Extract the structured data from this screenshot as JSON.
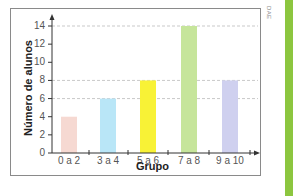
{
  "credit": "DAE",
  "chart_data": {
    "type": "bar",
    "title": "",
    "xlabel": "Grupo",
    "ylabel": "Número de alunos",
    "categories": [
      "0 a 2",
      "3 a 4",
      "5 a 6",
      "7 a 8",
      "9 a 10"
    ],
    "values": [
      4,
      6,
      8,
      14,
      8
    ],
    "colors": [
      "#f6d9d2",
      "#b9e6f7",
      "#f8f236",
      "#c6e59b",
      "#cfd0ef"
    ],
    "yticks": [
      0,
      2,
      4,
      6,
      8,
      10,
      12,
      14
    ],
    "ylim": [
      0,
      14
    ],
    "grid": "dashed horizontal lines at 6, 8, 14",
    "legend": "none"
  },
  "colors": {
    "frame": "#8a8a8a",
    "axis": "#333333",
    "grid": "#bbbbbb",
    "accent_stripe": "#8cc63f"
  }
}
